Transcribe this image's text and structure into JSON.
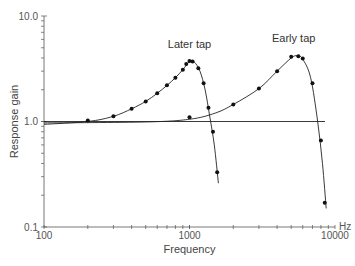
{
  "chart_data": {
    "type": "scatter",
    "title": "",
    "xlabel": "Frequency",
    "ylabel": "Response gain",
    "xunit": "Hz",
    "xscale": "log",
    "yscale": "log",
    "xlim": [
      100,
      10000
    ],
    "ylim": [
      0.1,
      10.0
    ],
    "x_tick_labels": [
      "100",
      "1000",
      "10000"
    ],
    "y_tick_labels": [
      "0.1",
      "1.0",
      "10.0"
    ],
    "grid": false,
    "legend": null,
    "annotations": [
      {
        "text": "Later tap",
        "x": 1000,
        "y": 4.6
      },
      {
        "text": "Early tap",
        "x": 5200,
        "y": 5.2
      }
    ],
    "series": [
      {
        "name": "Later tap",
        "points": [
          [
            200,
            1.02
          ],
          [
            300,
            1.12
          ],
          [
            400,
            1.32
          ],
          [
            500,
            1.55
          ],
          [
            600,
            1.85
          ],
          [
            700,
            2.2
          ],
          [
            800,
            2.6
          ],
          [
            900,
            3.1
          ],
          [
            950,
            3.5
          ],
          [
            1000,
            3.75
          ],
          [
            1050,
            3.7
          ],
          [
            1150,
            3.2
          ],
          [
            1250,
            2.3
          ],
          [
            1350,
            1.35
          ],
          [
            1450,
            0.8
          ],
          [
            1550,
            0.33
          ]
        ],
        "fit_curve": true
      },
      {
        "name": "Early tap",
        "points": [
          [
            1000,
            1.1
          ],
          [
            2000,
            1.45
          ],
          [
            3000,
            2.05
          ],
          [
            4000,
            3.0
          ],
          [
            5000,
            4.1
          ],
          [
            5600,
            4.15
          ],
          [
            6000,
            3.95
          ],
          [
            7000,
            2.3
          ],
          [
            8000,
            0.66
          ],
          [
            8500,
            0.17
          ]
        ],
        "fit_curve": true
      }
    ],
    "reference_line": {
      "y": 1.0,
      "style": "flat"
    }
  }
}
